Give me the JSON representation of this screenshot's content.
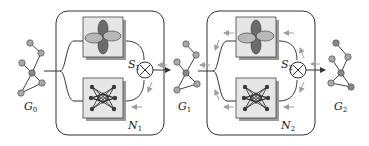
{
  "diagram": {
    "type": "pipeline",
    "colors": {
      "stroke": "#333333",
      "box_fill": "#e6e6e6",
      "box_shadow": "#9a9a9a",
      "node_fill": "#a8a8a8",
      "lobe_dark": "#6b6b6b",
      "lobe_light": "#b8b8b8",
      "gradient_arrow": "#a0a0a0"
    },
    "graphs": [
      {
        "id": "G0",
        "label": "G",
        "sub": "0"
      },
      {
        "id": "G1",
        "label": "G",
        "sub": "1"
      },
      {
        "id": "G2",
        "label": "G",
        "sub": "2"
      }
    ],
    "blocks": [
      {
        "id": "block-1",
        "filter": {
          "label": "S",
          "sub": "1",
          "icon": "orbital-lobes-icon"
        },
        "network": {
          "label": "N",
          "sub": "1",
          "icon": "neural-network-icon"
        },
        "combine": "⊗",
        "backward_arrows": "partial"
      },
      {
        "id": "block-2",
        "filter": {
          "label": "S",
          "sub": "2",
          "icon": "orbital-lobes-icon"
        },
        "network": {
          "label": "N",
          "sub": "2",
          "icon": "neural-network-icon"
        },
        "combine": "⊗",
        "backward_arrows": "full"
      }
    ]
  }
}
